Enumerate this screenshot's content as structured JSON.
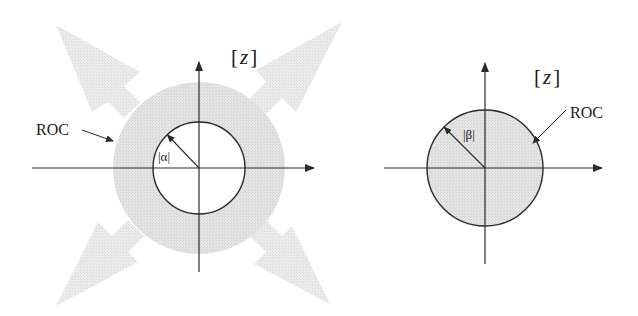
{
  "figure": {
    "colors": {
      "ink": "#2a2a2a",
      "roc_fill": "#dcdcdc",
      "arrow_fill": "#e6e6e6",
      "background": "#ffffff"
    },
    "left_panel": {
      "plane_label_open": "[",
      "plane_label_var": "z",
      "plane_label_close": "]",
      "roc_label": "ROC",
      "radius_label": "|α|",
      "description": "ROC outside circle of radius |α| extending outward (shaded annulus with outward arrows)",
      "center": [
        199,
        168
      ],
      "inner_radius": 46,
      "shaded_radius": 86
    },
    "right_panel": {
      "plane_label_open": "[",
      "plane_label_var": "z",
      "plane_label_close": "]",
      "roc_label": "ROC",
      "radius_label": "|β|",
      "description": "ROC inside circle of radius |β| (shaded disk)",
      "center": [
        485,
        168
      ],
      "radius": 58
    }
  }
}
